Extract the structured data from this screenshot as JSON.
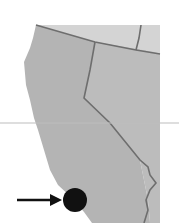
{
  "map": {
    "region": "California coast with Oregon and Nevada borders",
    "land_color": "#b4b4b4",
    "north_land_color": "#d2d2d2",
    "border_color": "#6e6e6e",
    "reference_line_color": "#bdbdbd",
    "marker": {
      "type": "dot",
      "color": "#111111",
      "cx": 75,
      "cy": 200,
      "r": 12
    },
    "arrow": {
      "color": "#111111",
      "from": [
        17,
        200
      ],
      "to": [
        61,
        200
      ]
    }
  }
}
